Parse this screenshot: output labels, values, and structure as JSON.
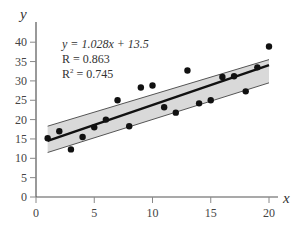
{
  "chart_data": {
    "type": "scatter",
    "title": "",
    "xlabel": "x",
    "ylabel": "y",
    "xlim": [
      0,
      20
    ],
    "ylim": [
      0,
      40
    ],
    "xticks": [
      0,
      5,
      10,
      15,
      20
    ],
    "yticks": [
      0,
      5,
      10,
      15,
      20,
      25,
      30,
      35,
      40
    ],
    "grid": false,
    "legend": null,
    "series": [
      {
        "name": "observations",
        "x": [
          1,
          2,
          3,
          4,
          5,
          6,
          7,
          8,
          9,
          10,
          11,
          12,
          13,
          14,
          15,
          16,
          17,
          18,
          19,
          20
        ],
        "y": [
          15.2,
          17.0,
          12.3,
          15.5,
          18.0,
          20.0,
          25.0,
          18.3,
          28.3,
          28.8,
          23.2,
          21.8,
          32.7,
          24.2,
          25.0,
          31.0,
          31.2,
          27.3,
          33.5,
          38.9
        ]
      }
    ],
    "regression": {
      "slope": 1.028,
      "intercept": 13.5,
      "x_range": [
        1,
        20
      ],
      "confidence_band": {
        "x": [
          1,
          20
        ],
        "lower": [
          11.5,
          29.5
        ],
        "upper": [
          18.3,
          35.5
        ]
      }
    },
    "annotations": {
      "equation": "y = 1.028x + 13.5",
      "r": "R = 0.863",
      "r2_prefix": "R",
      "r2_sup": "2",
      "r2_value": " = 0.745"
    },
    "colors": {
      "points": "#111111",
      "line": "#111111",
      "band_fill": "#d9d9d9",
      "band_edge": "#555555",
      "axis": "#555555"
    }
  }
}
